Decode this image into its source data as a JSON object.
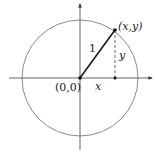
{
  "diagram": {
    "colors": {
      "circle": "#8a8a8a",
      "axes": "#555555",
      "radius": "#1a1a1a",
      "dashed": "#555555",
      "text": "#222222"
    },
    "labels": {
      "origin": "(0,0)",
      "point": "(x,y)",
      "radius": "1",
      "x_leg": "x",
      "y_leg": "y"
    }
  }
}
